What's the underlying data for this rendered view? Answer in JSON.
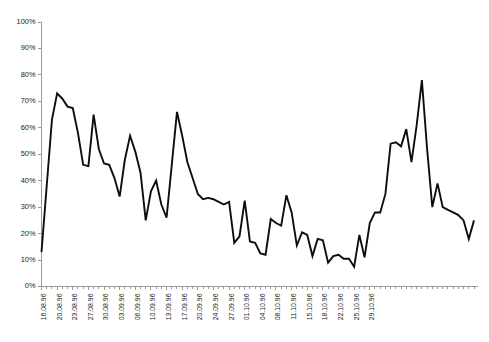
{
  "chart_data": {
    "type": "line",
    "title": "",
    "subtitle": "",
    "xlabel": "",
    "ylabel": "",
    "ylim": [
      0,
      100
    ],
    "ytick_labels": [
      "0%",
      "10%",
      "20%",
      "30%",
      "40%",
      "50%",
      "60%",
      "70%",
      "80%",
      "90%",
      "100%"
    ],
    "ytick_values": [
      0,
      10,
      20,
      30,
      40,
      50,
      60,
      70,
      80,
      90,
      100
    ],
    "grid": false,
    "legend": false,
    "legend_position": "none",
    "line_color": "#0d0d0d",
    "axis_color": "#9a9a9a",
    "background_color": "#ffffff",
    "x_label_interval": 3,
    "x_label_rotation": -90,
    "x": [
      "16.08.96",
      "17.08.96",
      "18.08.96",
      "19.08.96",
      "20.08.96",
      "21.08.96",
      "22.08.96",
      "23.08.96",
      "24.08.96",
      "25.08.96",
      "26.08.96",
      "27.08.96",
      "28.08.96",
      "29.08.96",
      "30.08.96",
      "31.08.96",
      "01.09.96",
      "02.09.96",
      "03.09.96",
      "04.09.96",
      "05.09.96",
      "06.09.96",
      "07.09.96",
      "08.09.96",
      "09.09.96",
      "10.09.96",
      "11.09.96",
      "12.09.96",
      "13.09.96",
      "14.09.96",
      "15.09.96",
      "16.09.96",
      "17.09.96",
      "18.09.96",
      "19.09.96",
      "20.09.96",
      "21.09.96",
      "22.09.96",
      "23.09.96",
      "24.09.96",
      "25.09.96",
      "26.09.96",
      "27.09.96",
      "28.09.96",
      "29.09.96",
      "30.09.96",
      "01.10.96",
      "02.10.96",
      "03.10.96",
      "04.10.96",
      "05.10.96",
      "06.10.96",
      "07.10.96",
      "08.10.96",
      "09.10.96",
      "10.10.96",
      "11.10.96",
      "12.10.96",
      "13.10.96",
      "14.10.96",
      "15.10.96",
      "16.10.96",
      "17.10.96",
      "18.10.96",
      "19.10.96",
      "20.10.96",
      "21.10.96",
      "22.10.96",
      "23.10.96",
      "24.10.96",
      "25.10.96",
      "26.10.96",
      "27.10.96",
      "28.10.96",
      "29.10.96",
      "30.10.96"
    ],
    "xtick_labels": [
      "16.08.96",
      "20.08.96",
      "23.08.96",
      "27.08.96",
      "30.08.96",
      "03.09.96",
      "06.09.96",
      "10.09.96",
      "13.09.96",
      "17.09.96",
      "20.09.96",
      "24.09.96",
      "27.09.96",
      "01.10.96",
      "04.10.96",
      "08.10.96",
      "11.10.96",
      "15.10.96",
      "18.10.96",
      "22.10.96",
      "25.10.96",
      "29.10.96"
    ],
    "values": [
      13,
      38,
      63,
      73,
      71,
      68,
      67.5,
      58,
      46,
      45.5,
      65,
      52,
      46.5,
      46,
      41,
      34,
      48,
      57,
      51,
      43,
      25,
      36,
      40,
      31,
      26,
      46,
      66,
      57,
      47,
      41,
      35,
      33,
      33.5,
      33,
      32,
      31,
      32,
      16.5,
      19,
      32.5,
      17,
      16.5,
      12.5,
      12,
      25.5,
      24,
      23,
      34.5,
      28,
      15.5,
      20.5,
      19.5,
      11.5,
      18,
      17.5,
      9,
      11.5,
      12,
      10.5,
      10.5,
      7.5,
      19.5,
      11,
      24,
      28,
      28,
      35,
      54,
      54.5,
      53,
      59.5,
      47,
      61,
      78,
      52,
      30
    ],
    "series": [
      {
        "name": "series-1",
        "values": [
          13,
          38,
          63,
          73,
          71,
          68,
          67.5,
          58,
          46,
          45.5,
          65,
          52,
          46.5,
          46,
          41,
          34,
          48,
          57,
          51,
          43,
          25,
          36,
          40,
          31,
          26,
          46,
          66,
          57,
          47,
          41,
          35,
          33,
          33.5,
          33,
          32,
          31,
          32,
          16.5,
          19,
          32.5,
          17,
          16.5,
          12.5,
          12,
          25.5,
          24,
          23,
          34.5,
          28,
          15.5,
          20.5,
          19.5,
          11.5,
          18,
          17.5,
          9,
          11.5,
          12,
          10.5,
          10.5,
          7.5,
          19.5,
          11,
          24,
          28,
          28,
          35,
          54,
          54.5,
          53,
          59.5,
          47,
          61,
          78,
          52,
          30
        ]
      }
    ],
    "trailing_values": [
      39,
      30,
      29,
      28,
      27,
      25,
      18,
      25
    ],
    "summary": {
      "minimum": 7.5,
      "maximum": 78,
      "start_value": 13,
      "end_value": 25
    }
  }
}
